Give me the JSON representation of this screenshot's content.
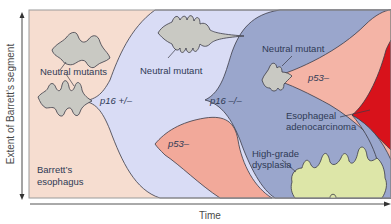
{
  "figure": {
    "y_axis_label": "Extent of Barrett’s segment",
    "x_axis_label": "Time",
    "colors": {
      "barretts": "#f6ddd0",
      "p16_het": "#d9dcf5",
      "p16_null": "#9aa6cc",
      "p53_loss": "#f2a99a",
      "p53_loss_light": "#f4b4a6",
      "adenocarcinoma": "#d8121b",
      "high_grade_dysplasia": "#dde6a8",
      "neutral_mutant": "#c9c9c3",
      "frame": "#9a9a9a"
    },
    "labels": {
      "neutral_mutants": "Neutral mutants",
      "neutral_mutant_1": "Neutral mutant",
      "neutral_mutant_2": "Neutral mutant",
      "p16_het": "p16 +/–",
      "p16_null": "p16 –/–",
      "p53_loss_1": "p53–",
      "p53_loss_2": "p53–",
      "esophageal_line1": "Esophageal",
      "esophageal_line2": "adenocarcinoma",
      "hgd_line1": "High-grade",
      "hgd_line2": "dysplasia",
      "barretts_line1": "Barrett’s",
      "barretts_line2": "esophagus"
    }
  }
}
